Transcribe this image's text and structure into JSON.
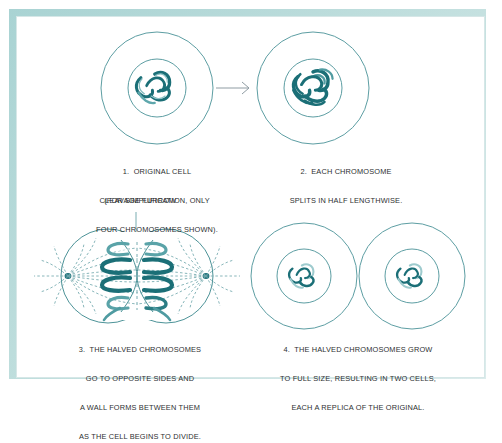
{
  "figure": {
    "accent_color": "#1b6f77",
    "line_color": "#3d8b90",
    "frame_color": "#b9dcdb",
    "text_color": "#2d2f31",
    "background": "#ffffff"
  },
  "annotations": {
    "cleavage_furrow": "CLEAVAGE FURROW"
  },
  "stages": [
    {
      "id": "stage-1",
      "number": "1.",
      "caption_lines": [
        "1.  ORIGINAL CELL",
        "(FOR SIMPLIFICATION, ONLY",
        "FOUR CHROMOSOMES SHOWN)."
      ],
      "cell_count": 1,
      "chromosome_count": 4,
      "phase": "interphase"
    },
    {
      "id": "stage-2",
      "number": "2.",
      "caption_lines": [
        "2.  EACH CHROMOSOME",
        "SPLITS IN HALF LENGTHWISE."
      ],
      "cell_count": 1,
      "chromosome_count": 8,
      "phase": "prophase-replication"
    },
    {
      "id": "stage-3",
      "number": "3.",
      "caption_lines": [
        "3.  THE HALVED CHROMOSOMES",
        "GO TO OPPOSITE SIDES AND",
        "A WALL FORMS BETWEEN THEM",
        "AS THE CELL BEGINS TO DIVIDE."
      ],
      "cell_count": 1,
      "chromosome_count": 8,
      "phase": "anaphase-telophase"
    },
    {
      "id": "stage-4",
      "number": "4.",
      "caption_lines": [
        "4.  THE HALVED CHROMOSOMES GROW",
        "TO FULL SIZE, RESULTING IN TWO CELLS,",
        "EACH A REPLICA OF THE ORIGINAL."
      ],
      "cell_count": 2,
      "chromosome_count": 4,
      "phase": "two-daughter-cells"
    }
  ],
  "flow": {
    "arrow_1_to_2": "arrow-right"
  }
}
